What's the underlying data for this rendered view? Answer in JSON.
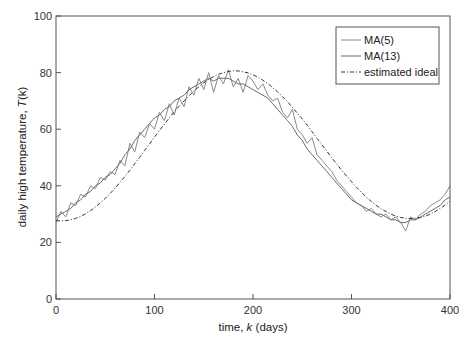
{
  "chart_data": {
    "type": "line",
    "title": "",
    "xlabel": "time, k (days)",
    "xlabel_parts": {
      "pre": "time, ",
      "var": "k",
      "post": " (days)"
    },
    "ylabel": "daily high temperature, T(k)",
    "ylabel_parts": {
      "pre": "daily high temperature, ",
      "var": "T",
      "post": "(k)"
    },
    "xlim": [
      0,
      400
    ],
    "ylim": [
      0,
      100
    ],
    "xticks": [
      0,
      100,
      200,
      300,
      400
    ],
    "yticks": [
      0,
      20,
      40,
      60,
      80,
      100
    ],
    "grid": false,
    "legend_position": "upper right",
    "legend": [
      "MA(5)",
      "MA(13)",
      "estimated ideal"
    ],
    "x": [
      0,
      5,
      10,
      15,
      20,
      25,
      30,
      35,
      40,
      45,
      50,
      55,
      60,
      65,
      70,
      75,
      80,
      85,
      90,
      95,
      100,
      105,
      110,
      115,
      120,
      125,
      130,
      135,
      140,
      145,
      150,
      155,
      160,
      165,
      170,
      175,
      180,
      185,
      190,
      195,
      200,
      205,
      210,
      215,
      220,
      225,
      230,
      235,
      240,
      245,
      250,
      255,
      260,
      265,
      270,
      275,
      280,
      285,
      290,
      295,
      300,
      305,
      310,
      315,
      320,
      325,
      330,
      335,
      340,
      345,
      350,
      355,
      360,
      365,
      370,
      375,
      380,
      385,
      390,
      395,
      400
    ],
    "series": [
      {
        "name": "MA(5)",
        "style": "solid",
        "color": "#8a8a8a",
        "values": [
          27,
          31,
          29,
          34,
          33,
          37,
          36,
          40,
          39,
          43,
          42,
          45,
          44,
          49,
          47,
          55,
          52,
          59,
          57,
          62,
          60,
          66,
          63,
          69,
          65,
          71,
          68,
          75,
          72,
          78,
          74,
          80,
          73,
          79,
          76,
          81,
          75,
          78,
          73,
          79,
          77,
          74,
          76,
          72,
          70,
          71,
          66,
          64,
          67,
          60,
          58,
          55,
          57,
          51,
          49,
          47,
          45,
          42,
          40,
          38,
          36,
          34,
          33,
          31,
          32,
          30,
          29,
          30,
          28,
          29,
          27,
          24,
          29,
          28,
          30,
          31,
          33,
          34,
          35,
          37,
          40
        ]
      },
      {
        "name": "MA(13)",
        "style": "solid",
        "color": "#6a6a6a",
        "values": [
          29,
          30,
          31,
          32,
          34,
          35,
          37,
          38,
          40,
          41,
          43,
          44,
          46,
          48,
          51,
          53,
          56,
          58,
          60,
          62,
          64,
          65,
          67,
          68,
          70,
          71,
          72,
          74,
          75,
          76,
          77,
          78,
          77,
          78,
          78,
          78,
          77,
          76,
          76,
          75,
          74,
          73,
          72,
          71,
          69,
          67,
          65,
          63,
          61,
          58,
          56,
          53,
          51,
          49,
          47,
          45,
          43,
          41,
          39,
          37,
          35,
          34,
          33,
          32,
          31,
          30,
          30,
          29,
          28,
          28,
          27,
          27,
          28,
          28,
          29,
          30,
          31,
          32,
          33,
          35,
          36
        ]
      },
      {
        "name": "estimated ideal",
        "style": "dash-dot",
        "color": "#333333",
        "values": [
          27.7,
          27.6,
          27.7,
          28.0,
          28.5,
          29.2,
          30.1,
          31.2,
          32.5,
          34.0,
          35.6,
          37.3,
          39.2,
          41.2,
          43.3,
          45.5,
          47.8,
          50.1,
          52.5,
          54.8,
          57.2,
          59.5,
          61.8,
          64.0,
          66.1,
          68.1,
          70.0,
          71.8,
          73.5,
          75.0,
          76.4,
          77.6,
          78.6,
          79.4,
          80.0,
          80.4,
          80.6,
          80.6,
          80.3,
          79.9,
          79.2,
          78.4,
          77.3,
          76.1,
          74.7,
          73.2,
          71.5,
          69.7,
          67.7,
          65.7,
          63.6,
          61.4,
          59.1,
          56.8,
          54.5,
          52.2,
          49.9,
          47.7,
          45.5,
          43.4,
          41.4,
          39.5,
          37.7,
          36.0,
          34.5,
          33.1,
          31.9,
          30.9,
          30.0,
          29.3,
          28.8,
          28.5,
          28.4,
          28.5,
          28.8,
          29.3,
          30.0,
          30.9,
          32.0,
          33.2,
          34.6
        ]
      }
    ]
  }
}
